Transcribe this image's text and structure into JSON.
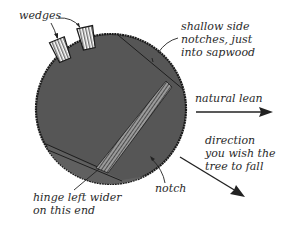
{
  "diagram": {
    "type": "tree-felling-cross-section",
    "colors": {
      "trunk": "#565656",
      "trunk_edge": "#1a1a1a",
      "notch_region": "#666666",
      "hinge_hatch": "#2a2a2a",
      "wedge_fill": "#ffffff",
      "line": "#222222",
      "text": "#2a2a2a"
    },
    "labels": {
      "wedges": "wedges",
      "side_notches": [
        "shallow side",
        "notches, just",
        "into sapwood"
      ],
      "natural_lean": "natural lean",
      "fall_direction": [
        "direction",
        "you wish the",
        "tree to fall"
      ],
      "notch": "notch",
      "hinge": [
        "hinge left wider",
        "on this end"
      ]
    },
    "arrows": [
      {
        "name": "natural-lean-arrow",
        "direction": "east"
      },
      {
        "name": "fall-direction-arrow",
        "direction": "southeast"
      }
    ]
  }
}
